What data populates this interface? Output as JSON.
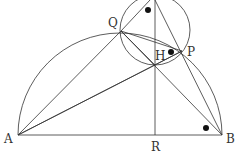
{
  "diagram": {
    "title": "",
    "points": {
      "A": {
        "label": "A",
        "x": 18,
        "y": 135
      },
      "B": {
        "label": "B",
        "x": 222,
        "y": 135
      },
      "R": {
        "label": "R",
        "x": 155,
        "y": 135
      },
      "Q": {
        "label": "Q",
        "x": 121,
        "y": 31
      },
      "P": {
        "label": "P",
        "x": 182,
        "y": 51
      },
      "H": {
        "label": "H",
        "x": 155,
        "y": 65
      },
      "T": {
        "label": "",
        "x": 155,
        "y": 0
      }
    },
    "semicircle": {
      "center": [
        120,
        135
      ],
      "radius": 102,
      "diameter": "AB"
    },
    "small_circle": {
      "center": [
        155,
        30
      ],
      "radius": 35
    },
    "segments": [
      "AB",
      "AQ",
      "AH",
      "AP",
      "QB",
      "HB",
      "PB",
      "RT",
      "QT",
      "QP",
      "QH",
      "TB"
    ],
    "angle_marks": [
      {
        "at": "Q-top",
        "x": 148,
        "y": 10
      },
      {
        "at": "H-P",
        "x": 171,
        "y": 51
      },
      {
        "at": "B",
        "x": 206,
        "y": 128
      }
    ]
  }
}
